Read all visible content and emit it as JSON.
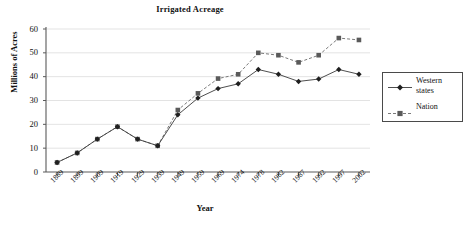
{
  "chart_data": {
    "type": "line",
    "title": "Irrigated Acreage",
    "xlabel": "Year",
    "ylabel": "Millions of Acres",
    "categories": [
      "1889",
      "1899",
      "1909",
      "1919",
      "1929",
      "1939",
      "1949",
      "1959",
      "1969",
      "1974",
      "1978",
      "1982",
      "1987",
      "1992",
      "1997",
      "2002"
    ],
    "series": [
      {
        "name": "Western states",
        "values": [
          4,
          8,
          13.8,
          19,
          13.8,
          11,
          24,
          31,
          35,
          37,
          43,
          41,
          38,
          39,
          43,
          41
        ],
        "marker": "diamond",
        "linestyle": "solid",
        "color": "#3a3a3a"
      },
      {
        "name": "Nation",
        "values": [
          4,
          8,
          13.8,
          19,
          13.8,
          11,
          26,
          33,
          39.2,
          41,
          50,
          49,
          46,
          49,
          56.2,
          55.4
        ],
        "marker": "square",
        "linestyle": "dashed",
        "color": "#6b6b6b"
      }
    ],
    "ylim": [
      0,
      60
    ],
    "yticks": [
      0,
      10,
      20,
      30,
      40,
      50,
      60
    ],
    "grid": "horizontal",
    "legend_position": "right-outside"
  },
  "legend": {
    "items": [
      {
        "label_line1": "Western",
        "label_line2": "states"
      },
      {
        "label_line1": "Nation",
        "label_line2": ""
      }
    ]
  }
}
